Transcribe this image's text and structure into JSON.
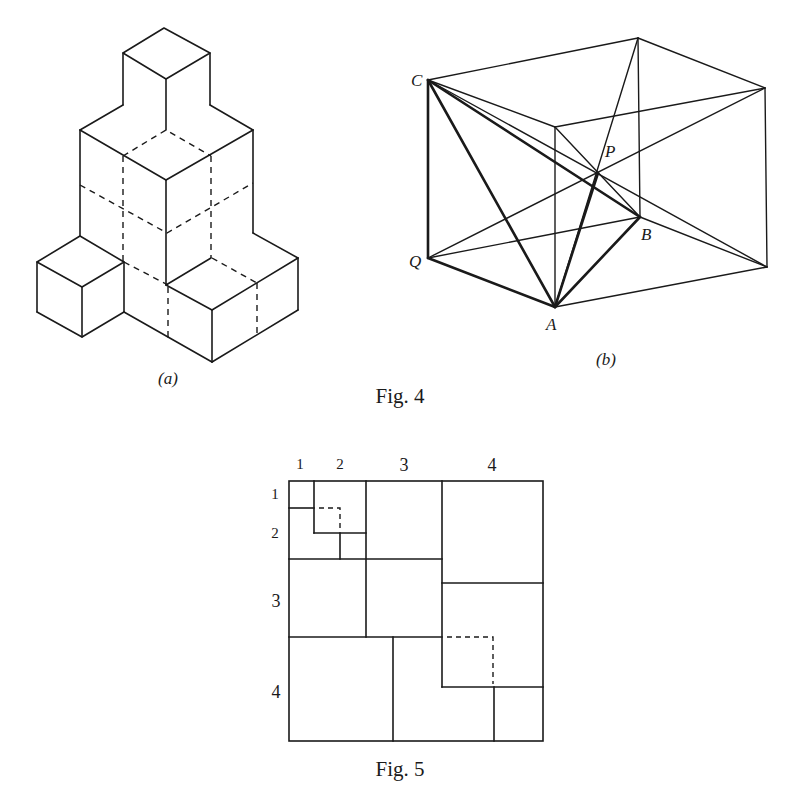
{
  "figure4": {
    "caption": "Fig. 4",
    "panel_a": {
      "label": "(a)",
      "description": "Isometric stack of unit cubes with hidden edges dashed"
    },
    "panel_b": {
      "label": "(b)",
      "points": {
        "C": "C",
        "P": "P",
        "B": "B",
        "Q": "Q",
        "A": "A"
      },
      "description": "Rectangular box with space diagonals meeting at P; tetrahedron CABP emphasised"
    }
  },
  "figure5": {
    "caption": "Fig. 5",
    "column_labels": [
      "1",
      "2",
      "3",
      "4"
    ],
    "row_labels": [
      "1",
      "2",
      "3",
      "4"
    ],
    "description": "Square divided into squares of sides 1, 2, 3, 4 with dashed overlaps"
  },
  "colors": {
    "ink": "#1a1a1a",
    "paper": "#ffffff"
  }
}
